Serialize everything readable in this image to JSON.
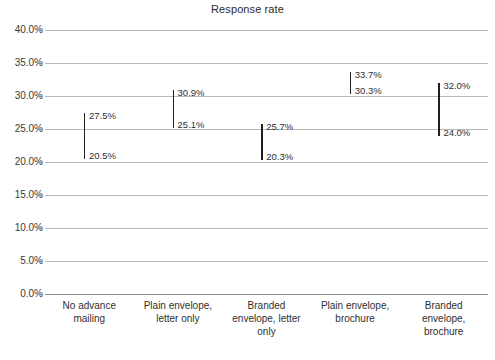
{
  "chart_data": {
    "type": "bar",
    "subtype": "range-bar",
    "title": "Response rate",
    "xlabel": "",
    "ylabel": "",
    "ylim": [
      0,
      40
    ],
    "ytick_step": 5,
    "ytick_labels": [
      "40.0%",
      "35.0%",
      "30.0%",
      "25.0%",
      "20.0%",
      "15.0%",
      "10.0%",
      "5.0%",
      "0.0%"
    ],
    "ytick_values": [
      40,
      35,
      30,
      25,
      20,
      15,
      10,
      5,
      0
    ],
    "grid": true,
    "legend": "none",
    "categories": [
      "No advance mailing",
      "Plain envelope, letter only",
      "Branded envelope, letter only",
      "Plain envelope, brochure",
      "Branded envelope, brochure"
    ],
    "category_lines": [
      [
        "No advance",
        "mailing"
      ],
      [
        "Plain envelope,",
        "letter only"
      ],
      [
        "Branded",
        "envelope, letter",
        "only"
      ],
      [
        "Plain envelope,",
        "brochure"
      ],
      [
        "Branded",
        "envelope,",
        "brochure"
      ]
    ],
    "series": [
      {
        "name": "high",
        "values": [
          27.5,
          30.9,
          25.7,
          33.7,
          32.0
        ],
        "labels": [
          "27.5%",
          "30.9%",
          "25.7%",
          "33.7%",
          "32.0%"
        ]
      },
      {
        "name": "low",
        "values": [
          20.5,
          25.1,
          20.3,
          30.3,
          24.0
        ],
        "labels": [
          "20.5%",
          "25.1%",
          "20.3%",
          "30.3%",
          "24.0%"
        ]
      }
    ],
    "colors": {
      "bar": "#1f1f1f",
      "gridline": "#b9b9b9",
      "baseline": "#8d8d8d",
      "text": "#2f2f2f",
      "background": "#ffffff"
    }
  }
}
